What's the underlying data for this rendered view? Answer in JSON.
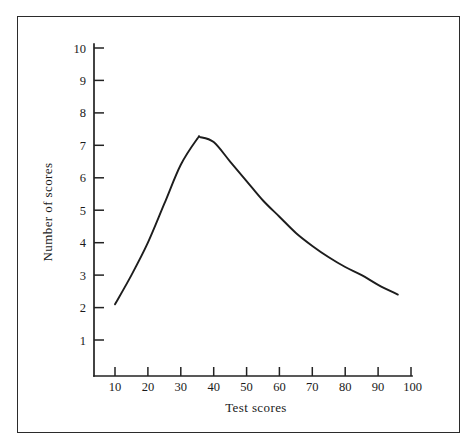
{
  "figure": {
    "background_color": "#ffffff",
    "frame_color": "#2b2b2b",
    "curve_color": "#1d1d1d"
  },
  "chart_data": {
    "type": "line",
    "title": "",
    "subtitle": "",
    "xlabel": "Test scores",
    "ylabel": "Number of scores",
    "xlim": [
      0,
      100
    ],
    "ylim": [
      0,
      10
    ],
    "grid": false,
    "legend": null,
    "xticks": [
      10,
      20,
      30,
      40,
      50,
      60,
      70,
      80,
      90,
      100
    ],
    "xtick_labels": [
      "10",
      "20",
      "30",
      "40",
      "50",
      "60",
      "70",
      "80",
      "90",
      "100"
    ],
    "yticks": [
      1,
      2,
      3,
      4,
      5,
      6,
      7,
      8,
      9,
      10
    ],
    "ytick_labels": [
      "1",
      "2",
      "3",
      "4",
      "5",
      "6",
      "7",
      "8",
      "9",
      "10"
    ],
    "series": [
      {
        "name": "Score distribution",
        "x": [
          10,
          15,
          20,
          25,
          30,
          35,
          36,
          40,
          45,
          50,
          55,
          60,
          65,
          70,
          75,
          80,
          85,
          90,
          96
        ],
        "values": [
          2.1,
          3.0,
          4.0,
          5.2,
          6.4,
          7.2,
          7.25,
          7.1,
          6.5,
          5.9,
          5.3,
          4.8,
          4.3,
          3.9,
          3.55,
          3.25,
          3.0,
          2.7,
          2.4
        ]
      }
    ],
    "annotations": {
      "peak_x": 36,
      "peak_y": 7.25,
      "start_point": [
        10,
        2.1
      ],
      "end_point": [
        96,
        2.4
      ],
      "shape": "unimodal positively skewed distribution"
    }
  },
  "axes": {
    "x_axis_name": "Test scores",
    "y_axis_name": "Number of scores"
  }
}
